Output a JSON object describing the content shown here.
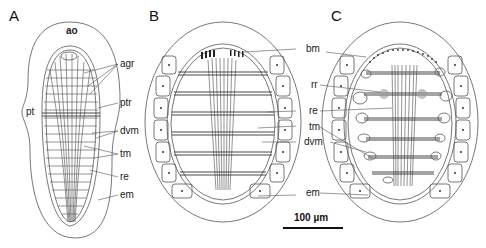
{
  "figure": {
    "panels": [
      {
        "letter": "A",
        "labels": {
          "top": "ao",
          "side": "pt",
          "right": [
            "agr",
            "ptr",
            "dvm",
            "tm",
            "re",
            "em"
          ]
        }
      },
      {
        "letter": "B",
        "labels": {
          "right": [
            "bm",
            "re",
            "tm",
            "dvm",
            "em"
          ]
        }
      },
      {
        "letter": "C",
        "labels": {
          "left": [
            "bm",
            "rr",
            "re",
            "tm",
            "dvm",
            "em"
          ]
        }
      }
    ],
    "shared_labels": {
      "bm": "bm",
      "rr": "rr",
      "re": "re",
      "tm": "tm",
      "dvm": "dvm",
      "em": "em"
    },
    "scale_bar": {
      "label": "100 µm"
    }
  }
}
